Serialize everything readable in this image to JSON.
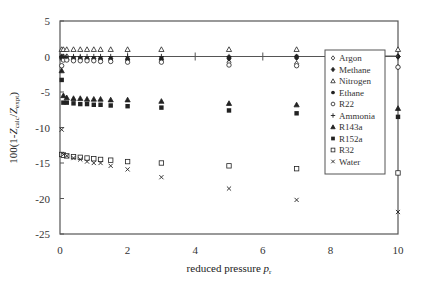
{
  "chart_data": {
    "type": "scatter",
    "title": "",
    "xlabel": "reduced pressure p_r",
    "xlabel_main": "reduced pressure ",
    "xlabel_var": "p",
    "xlabel_sub": "r",
    "ylabel": "100(1-Z_calc/Z_expt)",
    "ylabel_parts": {
      "pre": "100(1-",
      "z1": "Z",
      "sub1": "calc",
      "mid": "/",
      "z2": "Z",
      "sub2": "expt",
      "post": ")"
    },
    "xlim": [
      0,
      10
    ],
    "ylim": [
      -25,
      5
    ],
    "xticks": [
      0,
      2,
      4,
      6,
      8,
      10
    ],
    "yticks": [
      5,
      0,
      -5,
      -10,
      -15,
      -20,
      -25
    ],
    "grid": false,
    "legend_position": "upper right (inside)",
    "series": [
      {
        "name": "Argon",
        "marker": "diamond-open",
        "x": [
          0.05,
          0.1,
          0.2,
          0.4,
          0.6,
          0.8,
          1.0,
          1.2,
          1.5,
          2,
          3,
          5,
          7,
          10
        ],
        "y": [
          0,
          0,
          0,
          -0.2,
          -0.2,
          -0.3,
          -0.3,
          -0.3,
          -0.3,
          -0.4,
          -0.5,
          -0.8,
          -1.0,
          -1.5
        ]
      },
      {
        "name": "Methane",
        "marker": "diamond-filled",
        "x": [
          0.05,
          0.1,
          0.2,
          0.4,
          0.6,
          0.8,
          1.0,
          1.2,
          1.5,
          2,
          3,
          5,
          7,
          10
        ],
        "y": [
          -0.2,
          -0.3,
          -0.4,
          -0.4,
          -0.4,
          -0.4,
          -0.5,
          -0.5,
          -0.5,
          -0.5,
          -0.4,
          -0.3,
          -0.2,
          0
        ]
      },
      {
        "name": "Nitrogen",
        "marker": "triangle-open",
        "x": [
          0.05,
          0.1,
          0.2,
          0.4,
          0.6,
          0.8,
          1.0,
          1.2,
          1.5,
          2,
          3,
          5,
          7,
          10
        ],
        "y": [
          1.0,
          1.0,
          1.0,
          1.0,
          1.0,
          1.0,
          1.0,
          1.0,
          1.0,
          1.0,
          1.0,
          1.0,
          1.0,
          1.0
        ]
      },
      {
        "name": "Ethane",
        "marker": "circle-filled",
        "x": [
          0.05,
          0.1,
          0.2,
          0.4,
          0.6,
          0.8,
          1.0,
          1.2,
          1.5,
          2,
          3,
          5,
          7,
          10
        ],
        "y": [
          -0.1,
          -0.2,
          -0.3,
          -0.3,
          -0.3,
          -0.3,
          -0.3,
          -0.3,
          -0.3,
          -0.3,
          -0.2,
          -0.1,
          0,
          0
        ]
      },
      {
        "name": "R22",
        "marker": "circle-open",
        "x": [
          0.05,
          0.1,
          0.2,
          0.4,
          0.6,
          0.8,
          1.0,
          1.2,
          1.5,
          2,
          3,
          5,
          7,
          10
        ],
        "y": [
          -1.3,
          -0.5,
          -0.5,
          -0.6,
          -0.6,
          -0.6,
          -0.6,
          -0.7,
          -0.7,
          -0.8,
          -0.8,
          -1.2,
          -1.3,
          -1.5
        ]
      },
      {
        "name": "Ammonia",
        "marker": "plus",
        "x": [
          0.05,
          0.1,
          0.2,
          0.4,
          0.6,
          0.8,
          1.0,
          1.2,
          1.5,
          2,
          3,
          5,
          7,
          10
        ],
        "y": [
          0,
          0,
          0,
          0,
          0,
          0,
          0,
          0,
          0,
          0,
          0,
          0,
          0,
          0
        ]
      },
      {
        "name": "R143a",
        "marker": "triangle-filled",
        "x": [
          0.05,
          0.1,
          0.2,
          0.4,
          0.6,
          0.8,
          1.0,
          1.2,
          1.5,
          2,
          3,
          5,
          7,
          10
        ],
        "y": [
          -2.0,
          -5.5,
          -5.8,
          -5.9,
          -5.9,
          -6.0,
          -6.0,
          -6.0,
          -6.1,
          -6.1,
          -6.3,
          -6.6,
          -6.8,
          -7.3
        ]
      },
      {
        "name": "R152a",
        "marker": "square-filled",
        "x": [
          0.05,
          0.1,
          0.2,
          0.4,
          0.6,
          0.8,
          1.0,
          1.2,
          1.5,
          2,
          3,
          5,
          7,
          10
        ],
        "y": [
          -3.3,
          -6.5,
          -6.5,
          -6.6,
          -6.7,
          -6.7,
          -6.8,
          -6.8,
          -6.9,
          -7.0,
          -7.2,
          -7.6,
          -8.0,
          -8.5
        ]
      },
      {
        "name": "R32",
        "marker": "square-open",
        "x": [
          0.05,
          0.1,
          0.2,
          0.4,
          0.6,
          0.8,
          1.0,
          1.2,
          1.5,
          2,
          3,
          5,
          7,
          10
        ],
        "y": [
          -13.8,
          -13.9,
          -14.0,
          -14.1,
          -14.2,
          -14.3,
          -14.4,
          -14.5,
          -14.6,
          -14.8,
          -15.0,
          -15.4,
          -15.8,
          -16.4
        ]
      },
      {
        "name": "Water",
        "marker": "cross",
        "x": [
          0.05,
          0.1,
          0.2,
          0.4,
          0.6,
          0.8,
          1.0,
          1.2,
          1.5,
          2,
          3,
          5,
          7,
          10
        ],
        "y": [
          -10.3,
          -13.8,
          -14.0,
          -14.3,
          -14.5,
          -14.8,
          -15.0,
          -15.0,
          -15.4,
          -15.9,
          -17.0,
          -18.6,
          -20.2,
          -21.9
        ]
      }
    ]
  },
  "legend": {
    "items": [
      "Argon",
      "Methane",
      "Nitrogen",
      "Ethane",
      "R22",
      "Ammonia",
      "R143a",
      "R152a",
      "R32",
      "Water"
    ]
  }
}
